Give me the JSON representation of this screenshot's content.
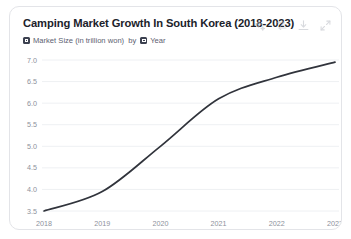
{
  "card": {
    "title": "Camping Market Growth In South Korea (2018-2023)",
    "subtitle": {
      "measure": "Market Size (in trillion won)",
      "connector": "by",
      "dimension": "Year"
    },
    "actions": [
      {
        "name": "sparkle-ai-icon",
        "label": "AI insights"
      },
      {
        "name": "sort-icon",
        "label": "Sort"
      },
      {
        "name": "download-icon",
        "label": "Download"
      },
      {
        "name": "expand-icon",
        "label": "Expand"
      }
    ]
  },
  "colors": {
    "line": "#31343c",
    "grid": "#eef0f3",
    "axis_text": "#8d919c",
    "title": "#20222a",
    "subtitle": "#5c6070",
    "card_border": "#e3e4e8",
    "badge": "#3c4150"
  },
  "chart_data": {
    "type": "line",
    "title": "Camping Market Growth In South Korea (2018-2023)",
    "xlabel": "Year",
    "ylabel": "Market Size (in trillion won)",
    "categories": [
      "2018",
      "2019",
      "2020",
      "2021",
      "2022",
      "2023"
    ],
    "x": [
      2018,
      2019,
      2020,
      2021,
      2022,
      2023
    ],
    "values": [
      3.5,
      3.95,
      5.0,
      6.1,
      6.6,
      6.95
    ],
    "series": [
      {
        "name": "Market Size (in trillion won)",
        "values": [
          3.5,
          3.95,
          5.0,
          6.1,
          6.6,
          6.95
        ]
      }
    ],
    "ylim": [
      3.5,
      7.0
    ],
    "yticks": [
      "7.0",
      "6.5",
      "6.0",
      "5.5",
      "5.0",
      "4.5",
      "4.0",
      "3.5"
    ],
    "ytick_values": [
      7.0,
      6.5,
      6.0,
      5.5,
      5.0,
      4.5,
      4.0,
      3.5
    ],
    "xticks": [
      "2018",
      "2019",
      "2020",
      "2021",
      "2022",
      "2023"
    ],
    "grid": true,
    "legend": false,
    "smooth": true
  }
}
